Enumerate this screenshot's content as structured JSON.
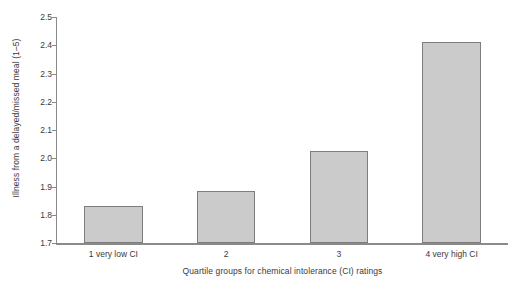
{
  "chart_data": {
    "type": "bar",
    "title": "",
    "categories": [
      "1 very low CI",
      "2",
      "3",
      "4 very high CI"
    ],
    "values": [
      1.83,
      1.885,
      2.025,
      2.41
    ],
    "xlabel": "Quartile groups for chemical intolerance (CI) ratings",
    "ylabel": "Illness from a delayed/missed meal (1–5)",
    "ylim": [
      1.7,
      2.5
    ],
    "yticks": [
      "1.7",
      "1.8",
      "1.9",
      "2.0",
      "2.1",
      "2.2",
      "2.3",
      "2.4",
      "2.5"
    ],
    "ytick_values": [
      1.7,
      1.8,
      1.9,
      2.0,
      2.1,
      2.2,
      2.3,
      2.4,
      2.5
    ],
    "grid": false,
    "legend": "none",
    "series": [
      {
        "name": "Illness from a delayed/missed meal",
        "values": [
          1.83,
          1.885,
          2.025,
          2.41
        ]
      }
    ],
    "colors": {
      "bar_fill": "#cbcbcb",
      "bar_border": "#7d7d7d",
      "axis": "#8a8a8a",
      "text": "#3a3a3a",
      "background": "#ffffff"
    }
  }
}
